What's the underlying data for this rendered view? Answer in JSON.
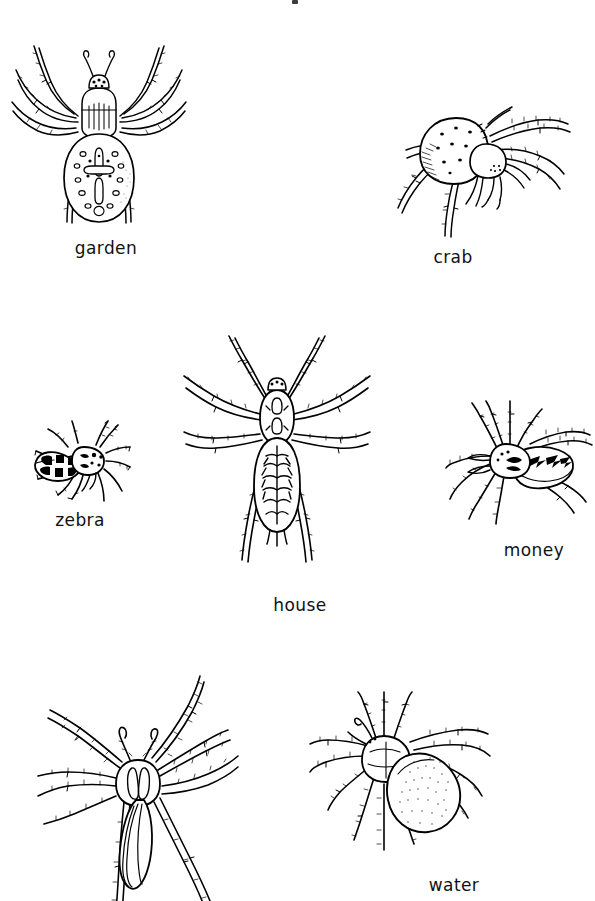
{
  "page": {
    "background_color": "#ffffff",
    "ink_color": "#000000",
    "width": 595,
    "height": 901,
    "style": "black-and-white line-art illustration plate"
  },
  "figures": [
    {
      "id": "garden",
      "label": "garden",
      "icon": "spider-garden-icon",
      "row": 1,
      "column": "left",
      "notes": "dorsal view, bulbous oval abdomen with cross-shaped marking and spots, eight long hairy legs"
    },
    {
      "id": "crab",
      "label": "crab",
      "icon": "spider-crab-icon",
      "row": 1,
      "column": "right",
      "notes": "side-angled view, large round speckled abdomen, legs angled forward crab-like"
    },
    {
      "id": "zebra",
      "label": "zebra",
      "icon": "spider-zebra-icon",
      "row": 2,
      "column": "left",
      "notes": "small stout body with banded striped abdomen, short legs"
    },
    {
      "id": "house",
      "label": "house",
      "icon": "spider-house-icon",
      "row": 2,
      "column": "center",
      "notes": "long sprawling legs, elongated abdomen with herringbone chevron markings"
    },
    {
      "id": "money",
      "label": "money",
      "icon": "spider-money-icon",
      "row": 2,
      "column": "right",
      "notes": "small spider angled to the right, oval abdomen with chevron markings"
    },
    {
      "id": "unlabelled-bottom-left",
      "label": "",
      "icon": "spider-longlegged-icon",
      "row": 3,
      "column": "left",
      "notes": "very long thin hairy legs, slender pointed abdomen, legs cropped by bottom edge of plate"
    },
    {
      "id": "water",
      "label": "water",
      "icon": "spider-water-icon",
      "row": 3,
      "column": "right",
      "notes": "angled view, plump stippled oval abdomen, hairy legs"
    }
  ],
  "captions": {
    "garden": "garden",
    "crab": "crab",
    "zebra": "zebra",
    "house": "house",
    "money": "money",
    "water": "water"
  }
}
